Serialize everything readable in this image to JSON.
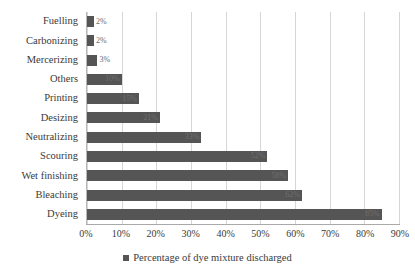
{
  "chart_data": {
    "type": "bar",
    "orientation": "horizontal",
    "title": "",
    "xlabel": "",
    "ylabel": "",
    "xlim": [
      0,
      90
    ],
    "grid": true,
    "legend_position": "bottom",
    "categories": [
      "Fuelling",
      "Carbonizing",
      "Mercerizing",
      "Others",
      "Printing",
      "Desizing",
      "Neutralizing",
      "Scouring",
      "Wet finishing",
      "Bleaching",
      "Dyeing"
    ],
    "values": [
      2,
      2,
      3,
      10,
      15,
      21,
      33,
      52,
      58,
      62,
      85
    ],
    "data_labels": [
      "2%",
      "2%",
      "3%",
      "10%",
      "15%",
      "21%",
      "33%",
      "52%",
      "58%",
      "62%",
      "85%"
    ],
    "xticks": [
      0,
      10,
      20,
      30,
      40,
      50,
      60,
      70,
      80,
      90
    ],
    "xtick_labels": [
      "0%",
      "10%",
      "20%",
      "30%",
      "40%",
      "50%",
      "60%",
      "70%",
      "80%",
      "90%"
    ],
    "series": [
      {
        "name": "Percentage of dye mixture discharged",
        "color": "#555555",
        "values": [
          2,
          2,
          3,
          10,
          15,
          21,
          33,
          52,
          58,
          62,
          85
        ]
      }
    ]
  },
  "legend": {
    "label": "Percentage of dye mixture discharged"
  },
  "colors": {
    "bar": "#555555",
    "grid": "#d6d6d6",
    "axis": "#a9a9a9",
    "text": "#3a3a3a",
    "background": "#ffffff"
  }
}
